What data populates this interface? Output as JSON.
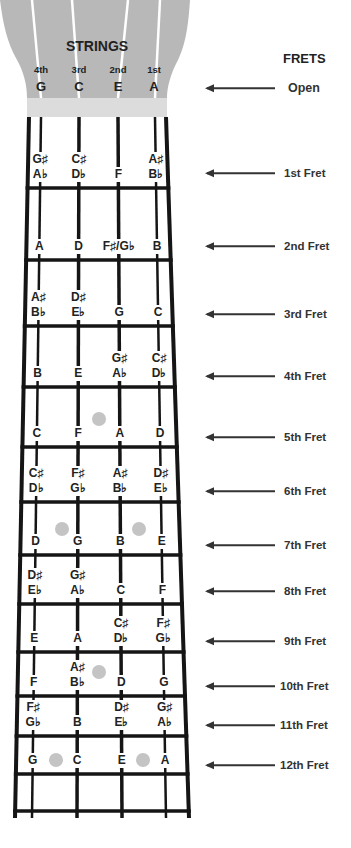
{
  "headstock": {
    "title": "STRINGS",
    "strings": [
      {
        "ordinal": "4th",
        "note": "G"
      },
      {
        "ordinal": "3rd",
        "note": "C"
      },
      {
        "ordinal": "2nd",
        "note": "E"
      },
      {
        "ordinal": "1st",
        "note": "A"
      }
    ]
  },
  "frets_header": "FRETS",
  "open_label": "Open",
  "colors": {
    "headstock": "#b8b8b8",
    "nut": "#dcdcdc",
    "lines": "#151515",
    "inlay": "#c4c4c4",
    "text": "#222222"
  },
  "frets": [
    {
      "label": "1st Fret",
      "notes": [
        [
          "G♯",
          "A♭"
        ],
        [
          "C♯",
          "D♭"
        ],
        [
          "F"
        ],
        [
          "A♯",
          "B♭"
        ]
      ]
    },
    {
      "label": "2nd Fret",
      "notes": [
        [
          "A"
        ],
        [
          "D"
        ],
        [
          "F♯/G♭"
        ],
        [
          "B"
        ]
      ]
    },
    {
      "label": "3rd Fret",
      "notes": [
        [
          "A♯",
          "B♭"
        ],
        [
          "D♯",
          "E♭"
        ],
        [
          "G"
        ],
        [
          "C"
        ]
      ]
    },
    {
      "label": "4th Fret",
      "notes": [
        [
          "B"
        ],
        [
          "E"
        ],
        [
          "G♯",
          "A♭"
        ],
        [
          "C♯",
          "D♭"
        ]
      ]
    },
    {
      "label": "5th Fret",
      "notes": [
        [
          "C"
        ],
        [
          "F"
        ],
        [
          "A"
        ],
        [
          "D"
        ]
      ]
    },
    {
      "label": "6th Fret",
      "notes": [
        [
          "C♯",
          "D♭"
        ],
        [
          "F♯",
          "G♭"
        ],
        [
          "A♯",
          "B♭"
        ],
        [
          "D♯",
          "E♭"
        ]
      ]
    },
    {
      "label": "7th Fret",
      "notes": [
        [
          "D"
        ],
        [
          "G"
        ],
        [
          "B"
        ],
        [
          "E"
        ]
      ]
    },
    {
      "label": "8th Fret",
      "notes": [
        [
          "D♯",
          "E♭"
        ],
        [
          "G♯",
          "A♭"
        ],
        [
          "C"
        ],
        [
          "F"
        ]
      ]
    },
    {
      "label": "9th Fret",
      "notes": [
        [
          "E"
        ],
        [
          "A"
        ],
        [
          "C♯",
          "D♭"
        ],
        [
          "F♯",
          "G♭"
        ]
      ]
    },
    {
      "label": "10th Fret",
      "notes": [
        [
          "F"
        ],
        [
          "A♯",
          "B♭"
        ],
        [
          "D"
        ],
        [
          "G"
        ]
      ]
    },
    {
      "label": "11th Fret",
      "notes": [
        [
          "F♯",
          "G♭"
        ],
        [
          "B"
        ],
        [
          "D♯",
          "E♭"
        ],
        [
          "G♯",
          "A♭"
        ]
      ]
    },
    {
      "label": "12th Fret",
      "notes": [
        [
          "G"
        ],
        [
          "C"
        ],
        [
          "E"
        ],
        [
          "A"
        ]
      ]
    }
  ],
  "inlay_frets": [
    5,
    7,
    10,
    12
  ]
}
